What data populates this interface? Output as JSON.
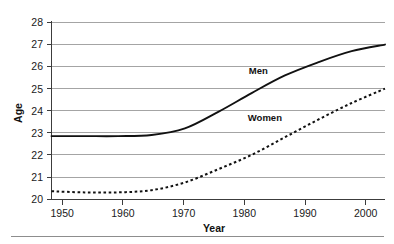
{
  "chart_data": {
    "type": "line",
    "title": "",
    "xlabel": "Year",
    "ylabel": "Age",
    "xlim": [
      1950,
      2000
    ],
    "ylim": [
      20,
      28
    ],
    "grid": true,
    "legend_position": "inline-annotation",
    "xticks": [
      "1950",
      "1960",
      "1970",
      "1980",
      "1990",
      "2000"
    ],
    "yticks": [
      "20",
      "21",
      "22",
      "23",
      "24",
      "25",
      "26",
      "27",
      "28"
    ],
    "x": [
      1950,
      1955,
      1960,
      1965,
      1970,
      1975,
      1980,
      1985,
      1990,
      1995,
      2000
    ],
    "series": [
      {
        "name": "Men",
        "style": "solid",
        "label": "Men",
        "values": [
          22.85,
          22.85,
          22.85,
          22.9,
          23.2,
          23.95,
          24.8,
          25.6,
          26.2,
          26.7,
          27.0
        ]
      },
      {
        "name": "Women",
        "style": "dotted",
        "label": "Women",
        "values": [
          20.35,
          20.3,
          20.3,
          20.4,
          20.75,
          21.35,
          22.0,
          22.8,
          23.6,
          24.35,
          25.0
        ]
      }
    ],
    "annotations": [
      {
        "text": "Men",
        "x": 1981,
        "y": 25.65
      },
      {
        "text": "Women",
        "x": 1982,
        "y": 23.55
      }
    ]
  }
}
